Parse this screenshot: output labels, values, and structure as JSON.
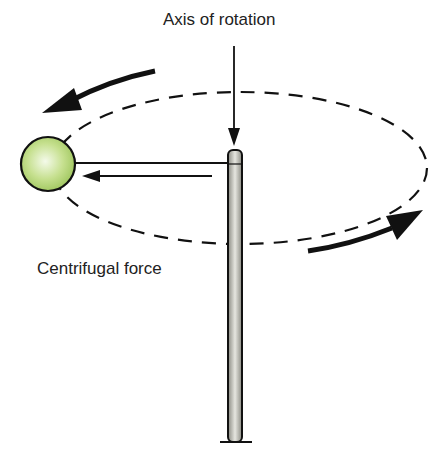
{
  "labels": {
    "axis": "Axis of rotation",
    "force": "Centrifugal force"
  },
  "colors": {
    "ball_fill": "#b5d77a",
    "ball_highlight": "#eef7dc",
    "pole_fill": "#c8c8c0",
    "stroke": "#111111"
  }
}
